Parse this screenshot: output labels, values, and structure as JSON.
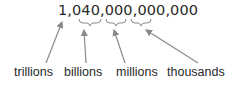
{
  "number": "1,040,000,000,000",
  "labels": {
    "trillions": "trillions",
    "billions": "billions",
    "millions": "millions",
    "thousands": "thousands"
  },
  "colors": {
    "text": "#2a2a2a",
    "arrow": "#8a8a8a"
  }
}
